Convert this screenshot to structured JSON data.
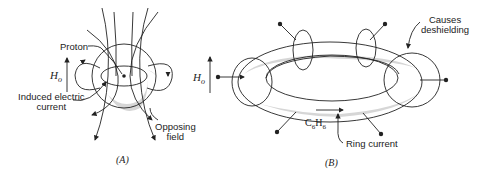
{
  "panel_a": {
    "caption": "(A)",
    "labels": {
      "proton": "Proton",
      "field": "H",
      "field_sub": "o",
      "induced_line1": "Induced electric",
      "induced_line2": "current",
      "opposing_line1": "Opposing",
      "opposing_line2": "field"
    }
  },
  "panel_b": {
    "caption": "(B)",
    "labels": {
      "field": "H",
      "field_sub": "o",
      "causes_line1": "Causes",
      "causes_line2": "deshielding",
      "molecule": "C",
      "molecule_sub1": "6",
      "molecule_mid": "H",
      "molecule_sub2": "6",
      "ring_current": "Ring current"
    }
  },
  "colors": {
    "line": "#222222",
    "shade": "#d6d6d6",
    "background": "#ffffff"
  }
}
